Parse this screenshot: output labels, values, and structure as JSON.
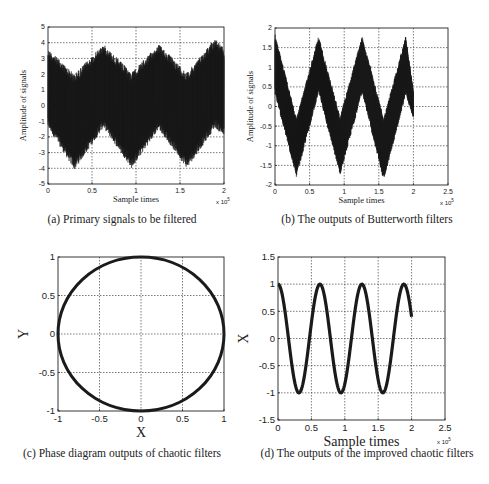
{
  "figure": {
    "panels": [
      {
        "id": "a",
        "caption": "(a) Primary signals to be filtered",
        "caption_pos": [
          122,
          222
        ]
      },
      {
        "id": "b",
        "caption": "(b) The outputs of Butterworth filters",
        "caption_pos": [
          367,
          222
        ]
      },
      {
        "id": "c",
        "caption": "(c) Phase diagram outputs of chaotic filters",
        "caption_pos": [
          122,
          456
        ]
      },
      {
        "id": "d",
        "caption": "(d) The outputs of the improved chaotic filters",
        "caption_pos": [
          367,
          456
        ]
      }
    ]
  },
  "chart_data": [
    {
      "id": "a",
      "type": "line",
      "title": "(a) Primary signals to be filtered",
      "xlabel": "Sample times",
      "ylabel": "Amplitude of signals",
      "x_multiplier": "x 10^5",
      "xlim": [
        0,
        2
      ],
      "ylim": [
        -5,
        5
      ],
      "xticks": [
        0,
        0.5,
        1,
        1.5,
        2
      ],
      "xtick_labels": [
        "0",
        "0.5",
        "1",
        "1.5",
        "2"
      ],
      "yticks": [
        -5,
        -4,
        -3,
        -2,
        -1,
        0,
        1,
        2,
        3,
        4,
        5
      ],
      "ytick_labels": [
        "-5",
        "-4",
        "-3",
        "-2",
        "-1",
        "0",
        "1",
        "2",
        "3",
        "4",
        "5"
      ],
      "grid": true,
      "description": "Dense noisy signal band: sinusoid of amplitude ~1 (period ~0.63e5 samples) plus high-frequency noise of amplitude ~3",
      "envelope": {
        "x": [
          0,
          0.3,
          0.63,
          0.95,
          1.26,
          1.58,
          1.9,
          2.0
        ],
        "upper": [
          3.6,
          2.0,
          3.9,
          2.1,
          3.9,
          2.1,
          4.3,
          3.6
        ],
        "lower": [
          -1.4,
          -4.1,
          -1.4,
          -4.0,
          -1.5,
          -4.0,
          -1.4,
          -2.0
        ]
      },
      "frame_px": {
        "left": 48,
        "top": 27,
        "right": 224,
        "bottom": 184
      }
    },
    {
      "id": "b",
      "type": "line",
      "title": "(b) The outputs of Butterworth filters",
      "xlabel": "Sample times",
      "ylabel": "Amplitude of signals",
      "x_multiplier": "x 10^5",
      "xlim": [
        0,
        2.5
      ],
      "ylim": [
        -2,
        2
      ],
      "xticks": [
        0,
        0.5,
        1,
        1.5,
        2,
        2.5
      ],
      "xtick_labels": [
        "0",
        "0.5",
        "1",
        "1.5",
        "2",
        "2.5"
      ],
      "yticks": [
        -2,
        -1.5,
        -1,
        -0.5,
        0,
        0.5,
        1,
        1.5,
        2
      ],
      "ytick_labels": [
        "-2",
        "-1.5",
        "-1",
        "-0.5",
        "0",
        "0.5",
        "1",
        "1.5",
        "2"
      ],
      "grid": true,
      "description": "Filtered noisy sinusoid band (data ends at x=2), thickness ~1.3",
      "envelope": {
        "x": [
          0,
          0.31,
          0.63,
          0.94,
          1.26,
          1.57,
          1.89,
          2.0
        ],
        "upper": [
          1.85,
          -0.3,
          1.8,
          -0.25,
          1.8,
          -0.3,
          1.8,
          0.4
        ],
        "lower": [
          0.3,
          -1.8,
          0.35,
          -1.75,
          0.35,
          -1.9,
          0.3,
          -0.3
        ]
      },
      "frame_px": {
        "left": 275,
        "top": 28,
        "right": 448,
        "bottom": 185
      }
    },
    {
      "id": "c",
      "type": "line",
      "title": "(c) Phase diagram outputs of chaotic filters",
      "xlabel": "X",
      "ylabel": "Y",
      "xlim": [
        -1,
        1
      ],
      "ylim": [
        -1,
        1
      ],
      "xticks": [
        -1,
        -0.5,
        0,
        0.5,
        1
      ],
      "xtick_labels": [
        "-1",
        "-0.5",
        "0",
        "0.5",
        "1"
      ],
      "yticks": [
        -1,
        -0.5,
        0,
        0.5,
        1
      ],
      "ytick_labels": [
        "-1",
        "-0.5",
        "0",
        "0.5",
        "1"
      ],
      "grid": true,
      "description": "Unit circle phase trajectory",
      "series": [
        {
          "name": "phase",
          "shape": "circle",
          "center": [
            0,
            0
          ],
          "radius": 1
        }
      ],
      "frame_px": {
        "left": 58,
        "top": 257,
        "right": 224,
        "bottom": 411
      }
    },
    {
      "id": "d",
      "type": "line",
      "title": "(d) The outputs of the improved chaotic filters",
      "xlabel": "Sample times",
      "ylabel": "X",
      "x_multiplier": "x 10^5",
      "xlim": [
        0,
        2.5
      ],
      "ylim": [
        -1.5,
        1.5
      ],
      "xticks": [
        0,
        0.5,
        1,
        1.5,
        2,
        2.5
      ],
      "xtick_labels": [
        "0",
        "0.5",
        "1",
        "1.5",
        "2",
        "2.5"
      ],
      "yticks": [
        -1.5,
        -1,
        -0.5,
        0,
        0.5,
        1,
        1.5
      ],
      "ytick_labels": [
        "-1.5",
        "-1",
        "-0.5",
        "0",
        "0.5",
        "1",
        "1.5"
      ],
      "grid": true,
      "description": "Clean cosine, amplitude 1, period ~0.628e5, from x=0 to x=2",
      "series": [
        {
          "name": "X",
          "function": "cos",
          "amplitude": 1,
          "period": 0.628,
          "x_start": 0,
          "x_end": 2
        }
      ],
      "frame_px": {
        "left": 278,
        "top": 257,
        "right": 445,
        "bottom": 420
      }
    }
  ]
}
